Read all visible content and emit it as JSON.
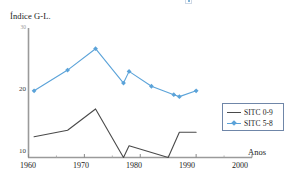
{
  "chart_data": {
    "type": "line",
    "title": "",
    "xlabel": "Anos",
    "ylabel": "Índice G-L.",
    "xlim": [
      1960,
      2000
    ],
    "ylim": [
      10,
      30
    ],
    "xticks": [
      1960,
      1970,
      1980,
      1990,
      2000
    ],
    "xtick_labels": [
      "1960",
      "1970",
      "1980",
      "1990",
      "2000"
    ],
    "xminor_ticks": [
      1965,
      1975,
      1985,
      1995
    ],
    "yticks": [
      10,
      20,
      30
    ],
    "ytick_labels": [
      "10",
      "20",
      "30"
    ],
    "grid": false,
    "legend_position": "right",
    "series": [
      {
        "name": "SITC 0-9",
        "color": "#4a4a4a",
        "marker": "none",
        "x": [
          1961,
          1967,
          1972,
          1977,
          1978,
          1985,
          1987,
          1990
        ],
        "values": [
          13.2,
          14.2,
          17.5,
          10.0,
          11.8,
          10.0,
          13.9,
          13.9
        ]
      },
      {
        "name": "SITC 5-8",
        "color": "#5ba3d9",
        "marker": "diamond",
        "x": [
          1961,
          1967,
          1972,
          1977,
          1978,
          1982,
          1986,
          1987,
          1990
        ],
        "values": [
          20.3,
          23.5,
          26.8,
          21.5,
          23.3,
          21.0,
          19.7,
          19.4,
          20.3
        ]
      }
    ]
  },
  "axis": {
    "y_label": "Índice G-L.",
    "x_label": "Anos"
  },
  "legend": {
    "entries": [
      {
        "label": "SITC 0-9"
      },
      {
        "label": "SITC 5-8"
      }
    ]
  },
  "colors": {
    "series_dark": "#4a4a4a",
    "series_blue": "#5ba3d9",
    "axis": "#8a8a8a",
    "legend_border": "#6f86a8",
    "text": "#1a1a1a"
  }
}
